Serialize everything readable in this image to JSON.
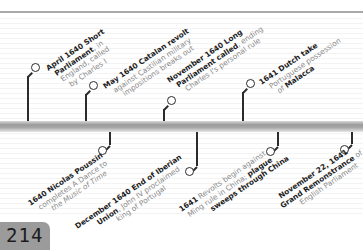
{
  "page": {
    "number": "214"
  },
  "timeline": {
    "events_above": [
      {
        "id": "april-1640",
        "bold": "April 1640 Short Parliament",
        "rest": ", in England, called by Charles I",
        "lines": [
          [
            "April 1640 Short",
            ""
          ],
          [
            "Parliament",
            ", in"
          ],
          [
            "",
            "England, called"
          ],
          [
            "",
            "by Charles I"
          ]
        ]
      },
      {
        "id": "may-1640",
        "bold": "May 1640 Catalan revolt",
        "rest": " against Castilian military impositions breaks out",
        "lines": [
          [
            "May 1640 Catalan revolt",
            ""
          ],
          [
            "",
            "against Castilian military"
          ],
          [
            "",
            "impositions breaks out"
          ]
        ]
      },
      {
        "id": "nov-1640",
        "bold": "November 1640 Long Parliament called",
        "rest": ", ending Charles I's personal rule",
        "lines": [
          [
            "November 1640 Long",
            ""
          ],
          [
            "Parliament called",
            ", ending"
          ],
          [
            "",
            "Charles I's personal rule"
          ]
        ]
      },
      {
        "id": "1641-dutch",
        "bold": "1641 Dutch take",
        "rest": " Portuguese possession of Malacca",
        "lines": [
          [
            "1641 Dutch take",
            ""
          ],
          [
            "",
            "Portuguese possession"
          ],
          [
            "",
            "of "
          ],
          [
            "Malacca",
            ""
          ]
        ]
      }
    ],
    "events_below": [
      {
        "id": "1640-poussin",
        "bold": "1640 Nicolas Poussin",
        "rest": " completes A Dance to the Music of Time",
        "lines": [
          [
            "1640 Nicolas Poussin",
            ""
          ],
          [
            "",
            "completes A Dance to"
          ],
          [
            "",
            "the Music of Time"
          ]
        ]
      },
      {
        "id": "dec-1640",
        "bold": "December 1640 End of Iberian Union",
        "rest": ", John IV proclaimed king of Portugal",
        "lines": [
          [
            "December 1640 End of Iberian",
            ""
          ],
          [
            "Union",
            ", John IV proclaimed"
          ],
          [
            "",
            "king of Portugal"
          ]
        ]
      },
      {
        "id": "1641-revolts",
        "bold": "1641",
        "rest": " Revolts begin against Ming rule in China; plague sweeps through China",
        "lines": [
          [
            "1641",
            " Revolts begin against"
          ],
          [
            "",
            "Ming rule in China; "
          ],
          [
            "sweeps through China",
            ""
          ]
        ],
        "extra_bold": "plague"
      },
      {
        "id": "nov-22-1641",
        "bold": "November 22, 1641 Grand Remonstrance",
        "rest": " of English Parliament",
        "lines": [
          [
            "November 22, 1641",
            ""
          ],
          [
            "Grand Remonstrance",
            " of"
          ],
          [
            "",
            "English Parliament"
          ]
        ]
      }
    ]
  },
  "colors": {
    "page_box": "#9b9b9b",
    "bar": "#a8a8a8",
    "stem": "#2b2b2b",
    "bold_text": "#1e1e1e",
    "regular_text": "#8a8a8a"
  }
}
